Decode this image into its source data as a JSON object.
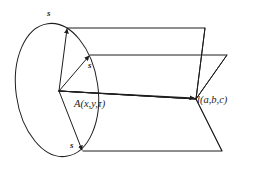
{
  "figure": {
    "type": "geometry-diagram",
    "background_color": "#ffffff",
    "stroke_color": "#1d1d1d",
    "labels": {
      "s_top": "s",
      "s_middle": "s",
      "s_bottom": "s",
      "point_a": "A(x,y,τ)",
      "point_l": "l(a,b,c)"
    },
    "geometry": {
      "ellipse": {
        "center_x": 57,
        "center_y": 90,
        "radius_x": 41,
        "radius_y": 67,
        "rotation_deg": -8
      },
      "origin": {
        "x": 59,
        "y": 91
      },
      "vertex_right": {
        "x": 196,
        "y": 99
      },
      "vectors": [
        {
          "name": "s-top",
          "to_x": 67,
          "to_y": 28
        },
        {
          "name": "s-middle",
          "to_x": 90,
          "to_y": 55
        },
        {
          "name": "s-bottom",
          "to_x": 83,
          "to_y": 151
        }
      ],
      "upper_plane": [
        [
          67,
          28
        ],
        [
          205,
          28
        ],
        [
          196,
          99
        ],
        [
          59,
          91
        ]
      ],
      "lower_plane": [
        [
          90,
          55
        ],
        [
          227,
          55
        ],
        [
          196,
          99
        ],
        [
          59,
          91
        ]
      ],
      "bottom_plane": [
        [
          83,
          151
        ],
        [
          222,
          151
        ],
        [
          196,
          99
        ],
        [
          59,
          91
        ]
      ],
      "right_edges": [
        {
          "from": [
            205,
            28
          ],
          "to": [
            196,
            99
          ]
        },
        {
          "from": [
            227,
            55
          ],
          "to": [
            196,
            99
          ]
        },
        {
          "from": [
            196,
            99
          ],
          "to": [
            222,
            151
          ]
        }
      ]
    }
  }
}
